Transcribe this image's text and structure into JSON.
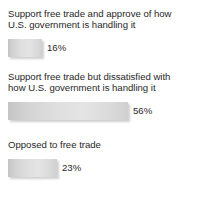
{
  "chart_data": {
    "type": "bar",
    "orientation": "horizontal",
    "title": "",
    "subtitle": "",
    "xlabel": "",
    "ylabel": "",
    "grid": false,
    "legend": false,
    "axis_visible": false,
    "value_suffix": "%",
    "xlim": [
      0,
      100
    ],
    "px_per_unit": 2.143,
    "categories": [
      "Support free trade and approve of how U.S. government is handling it",
      "Support free trade but dissatisfied with how U.S. government is handling it",
      "Opposed to free trade"
    ],
    "values": [
      16,
      56,
      23
    ],
    "bars": [
      {
        "label_lines": [
          "Support free trade and approve of how",
          "U.S. government is handling it"
        ],
        "label": "Support free trade and approve of how\nU.S. government is handling it",
        "value": 16,
        "value_label": "16%",
        "bar_width_px": 34
      },
      {
        "label_lines": [
          "Support free trade but dissatisfied with",
          "how U.S. government is handling it"
        ],
        "label": "Support free trade but dissatisfied with\nhow U.S. government is handling it",
        "value": 56,
        "value_label": "56%",
        "bar_width_px": 120
      },
      {
        "label_lines": [
          "Opposed to free trade"
        ],
        "label": "Opposed to free trade",
        "value": 23,
        "value_label": "23%",
        "bar_width_px": 49
      }
    ],
    "colors": {
      "background": "#ffffff",
      "text": "#282828",
      "bar_light": "#e4e4e4",
      "bar_mid": "#dedede",
      "bar_dark": "#c4c4c4",
      "bar_shadow": "#969696"
    }
  }
}
